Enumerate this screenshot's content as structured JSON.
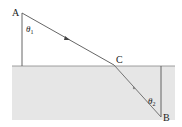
{
  "diagram": {
    "points": {
      "A": {
        "label": "A",
        "x": 22,
        "y": 13
      },
      "C": {
        "label": "C",
        "x": 114,
        "y": 65
      },
      "B": {
        "label": "B",
        "x": 161,
        "y": 117
      }
    },
    "angles": {
      "theta1": {
        "symbol": "θ",
        "subscript": "1"
      },
      "theta2": {
        "symbol": "θ",
        "subscript": "2"
      }
    },
    "colors": {
      "medium_fill": "#e6e6e6",
      "line": "#555555",
      "ray": "#666666"
    }
  }
}
